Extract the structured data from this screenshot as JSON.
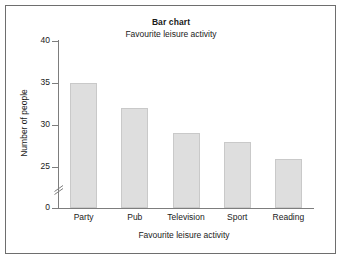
{
  "chart_data": {
    "type": "bar",
    "title": "Bar chart",
    "subtitle": "Favourite leisure activity",
    "xlabel": "Favourite leisure activity",
    "ylabel": "Number of people",
    "categories": [
      "Party",
      "Pub",
      "Television",
      "Sport",
      "Reading"
    ],
    "values": [
      35,
      32,
      29,
      28,
      26
    ],
    "yticks": [
      40,
      35,
      30,
      25,
      0
    ],
    "ytick_labels": [
      "40",
      "35",
      "30",
      "25",
      "0"
    ],
    "ylim": [
      24,
      40
    ],
    "axis_break": true,
    "axis_break_between": [
      0,
      25
    ],
    "grid": false,
    "legend": "none",
    "bar_color": "#dedede",
    "bar_border_color": "#c9c9c9",
    "axis_color": "#7d7d7d",
    "text_color": "#1a1a1a",
    "frame_color": "#6e6e6e",
    "background": "#ffffff"
  }
}
